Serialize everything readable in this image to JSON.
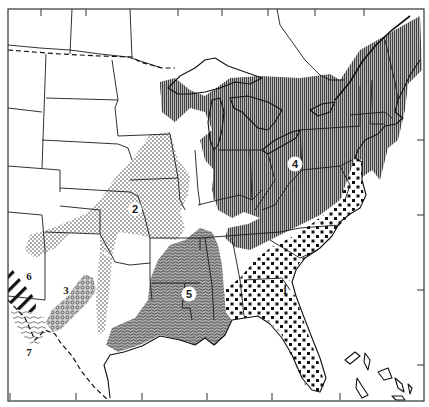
{
  "map": {
    "title": "",
    "region_shown": "Eastern and Central United States",
    "style": "black-and-white patterned range map",
    "frame": {
      "left": 8,
      "top": 9,
      "right": 424,
      "bottom": 401
    },
    "zones": [
      {
        "id": "1",
        "label": "1",
        "pattern": "large-dots-checker",
        "area": "Southeastern coastal plain: Florida, Georgia, South Carolina, North Carolina, southern Alabama, Atlantic coast to Delaware"
      },
      {
        "id": "2",
        "label": "2",
        "pattern": "fine-dots",
        "area": "Central prairie: Iowa, Missouri, eastern Kansas, Nebraska, Oklahoma, northern Texas"
      },
      {
        "id": "3",
        "label": "3",
        "pattern": "small-circles",
        "area": "Central Texas (Edwards Plateau)"
      },
      {
        "id": "4",
        "label": "4",
        "pattern": "vertical-lines",
        "area": "Northeast and Great Lakes: New England, New York, Pennsylvania, Ohio, Michigan, Indiana, West Virginia, Kentucky, Tennessee"
      },
      {
        "id": "5",
        "label": "5",
        "pattern": "wavy-lines",
        "area": "Lower Mississippi valley and Gulf coast: Louisiana, Mississippi, Arkansas, eastern Texas"
      },
      {
        "id": "6",
        "label": "6",
        "pattern": "diagonal-heavy-lines",
        "area": "Western Texas / New Mexico border"
      },
      {
        "id": "7",
        "label": "7",
        "pattern": "wavy-fine-lines",
        "area": "Trans-Pecos / Big Bend Texas"
      }
    ],
    "labels": [
      {
        "text": "1",
        "x": 285,
        "y": 290
      },
      {
        "text": "2",
        "x": 135,
        "y": 210
      },
      {
        "text": "3",
        "x": 66,
        "y": 290
      },
      {
        "text": "4",
        "x": 295,
        "y": 166
      },
      {
        "text": "5",
        "x": 189,
        "y": 295
      },
      {
        "text": "6",
        "x": 28,
        "y": 276
      },
      {
        "text": "7",
        "x": 29,
        "y": 352
      }
    ],
    "colors": {
      "ink": "#1a1a1a",
      "paper": "#ffffff",
      "shade": "#8a8a8a"
    }
  }
}
